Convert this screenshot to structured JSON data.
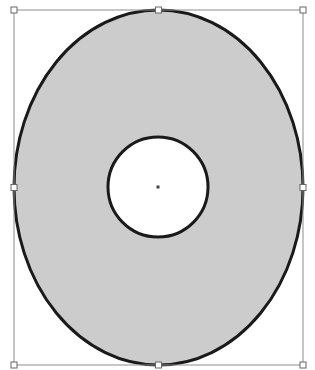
{
  "shape": {
    "type": "ellipse-with-hole",
    "outer": {
      "cx": 158.5,
      "cy": 187.5,
      "rx": 144.5,
      "ry": 177.5
    },
    "inner": {
      "cx": 158,
      "cy": 187,
      "r": 50
    },
    "fill": "#cccccc",
    "stroke": "#1a1a1a",
    "stroke_width": 3
  },
  "selection": {
    "box": {
      "x": 14,
      "y": 10,
      "w": 289,
      "h": 355
    },
    "stroke": "#8c8c8c",
    "handle_fill": "#ffffff",
    "handle_stroke": "#666666",
    "center_marker": "#444444"
  }
}
